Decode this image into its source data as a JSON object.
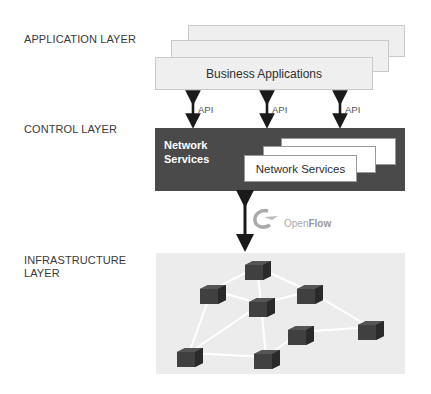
{
  "layers": {
    "application": "APPLICATION LAYER",
    "control": "CONTROL LAYER",
    "infrastructure_line1": "INFRASTRUCTURE",
    "infrastructure_line2": "LAYER"
  },
  "application_layer": {
    "box_label": "Business Applications",
    "stack_count": 3
  },
  "api_arrows": [
    {
      "label": "API"
    },
    {
      "label": "API"
    },
    {
      "label": "API"
    }
  ],
  "control_layer": {
    "title_line1": "Network",
    "title_line2": "Services",
    "inner_box_label": "Network Services",
    "stack_count": 3
  },
  "protocol": {
    "name_part1": "Open",
    "name_part2": "Flow",
    "icon": "openflow-logo-icon"
  },
  "infrastructure_layer": {
    "device_icon": "network-switch-icon",
    "device_count": 8
  },
  "colors": {
    "control_bg": "#4a4a4a",
    "app_bg": "#efefef",
    "infra_bg": "#ececec",
    "arrow": "#1a1a1a",
    "switch": "#3b3b3b"
  }
}
